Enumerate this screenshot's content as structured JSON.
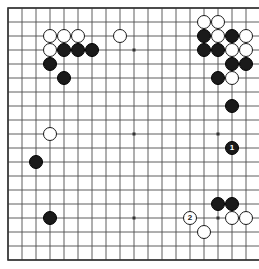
{
  "board": {
    "size": 19,
    "origin_x": 8,
    "origin_y": 8,
    "spacing": 14,
    "stone_radius": 7.2,
    "line_color": "#4d4d4d",
    "border_color": "#333333",
    "background_color": "#ffffff",
    "black_color": "#1a1a1a",
    "white_color": "#ffffff",
    "star_points": [
      [
        3,
        3
      ],
      [
        9,
        3
      ],
      [
        15,
        3
      ],
      [
        3,
        9
      ],
      [
        9,
        9
      ],
      [
        15,
        9
      ],
      [
        3,
        15
      ],
      [
        9,
        15
      ],
      [
        15,
        15
      ]
    ],
    "stones": [
      {
        "color": "white",
        "col": 3,
        "row": 2,
        "label": ""
      },
      {
        "color": "white",
        "col": 4,
        "row": 2,
        "label": ""
      },
      {
        "color": "white",
        "col": 5,
        "row": 2,
        "label": ""
      },
      {
        "color": "white",
        "col": 8,
        "row": 2,
        "label": ""
      },
      {
        "color": "white",
        "col": 3,
        "row": 3,
        "label": ""
      },
      {
        "color": "black",
        "col": 4,
        "row": 3,
        "label": ""
      },
      {
        "color": "black",
        "col": 5,
        "row": 3,
        "label": ""
      },
      {
        "color": "black",
        "col": 6,
        "row": 3,
        "label": ""
      },
      {
        "color": "black",
        "col": 3,
        "row": 4,
        "label": ""
      },
      {
        "color": "black",
        "col": 4,
        "row": 5,
        "label": ""
      },
      {
        "color": "white",
        "col": 14,
        "row": 1,
        "label": ""
      },
      {
        "color": "white",
        "col": 15,
        "row": 1,
        "label": ""
      },
      {
        "color": "black",
        "col": 14,
        "row": 2,
        "label": ""
      },
      {
        "color": "white",
        "col": 15,
        "row": 2,
        "label": ""
      },
      {
        "color": "black",
        "col": 16,
        "row": 2,
        "label": ""
      },
      {
        "color": "white",
        "col": 17,
        "row": 2,
        "label": ""
      },
      {
        "color": "black",
        "col": 14,
        "row": 3,
        "label": ""
      },
      {
        "color": "black",
        "col": 15,
        "row": 3,
        "label": ""
      },
      {
        "color": "white",
        "col": 16,
        "row": 3,
        "label": ""
      },
      {
        "color": "white",
        "col": 17,
        "row": 3,
        "label": ""
      },
      {
        "color": "black",
        "col": 16,
        "row": 4,
        "label": ""
      },
      {
        "color": "black",
        "col": 17,
        "row": 4,
        "label": ""
      },
      {
        "color": "black",
        "col": 15,
        "row": 5,
        "label": ""
      },
      {
        "color": "white",
        "col": 16,
        "row": 5,
        "label": ""
      },
      {
        "color": "black",
        "col": 16,
        "row": 7,
        "label": ""
      },
      {
        "color": "white",
        "col": 3,
        "row": 9,
        "label": ""
      },
      {
        "color": "black",
        "col": 16,
        "row": 10,
        "label": "1"
      },
      {
        "color": "black",
        "col": 2,
        "row": 11,
        "label": ""
      },
      {
        "color": "black",
        "col": 3,
        "row": 15,
        "label": ""
      },
      {
        "color": "black",
        "col": 15,
        "row": 14,
        "label": ""
      },
      {
        "color": "black",
        "col": 16,
        "row": 14,
        "label": ""
      },
      {
        "color": "white",
        "col": 13,
        "row": 15,
        "label": "2"
      },
      {
        "color": "white",
        "col": 16,
        "row": 15,
        "label": ""
      },
      {
        "color": "white",
        "col": 17,
        "row": 15,
        "label": ""
      },
      {
        "color": "white",
        "col": 14,
        "row": 16,
        "label": ""
      }
    ]
  },
  "labels": {
    "move_one": "1",
    "move_two": "2"
  }
}
